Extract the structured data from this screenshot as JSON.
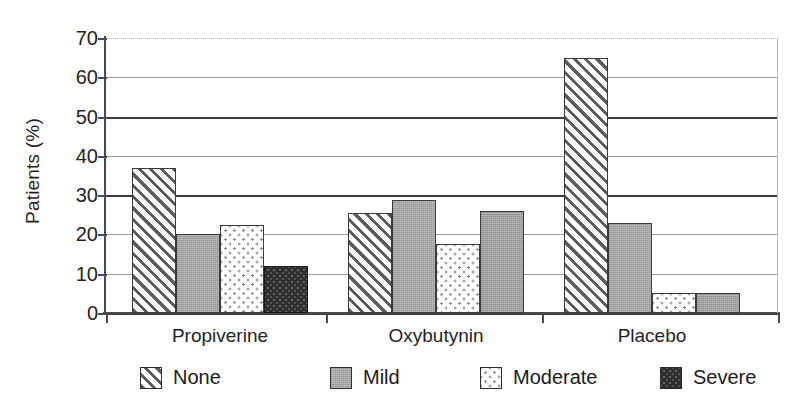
{
  "chart_data": {
    "type": "bar",
    "title": "",
    "subtitle": "",
    "xlabel": "",
    "ylabel": "Patients (%)",
    "ylim": [
      0,
      70
    ],
    "yticks": [
      0,
      10,
      20,
      30,
      40,
      50,
      60,
      70
    ],
    "ytick_labels": [
      "0",
      "10",
      "20",
      "30",
      "40",
      "50",
      "60",
      "70"
    ],
    "categories": [
      "Propiverine",
      "Oxybutynin",
      "Placebo"
    ],
    "grid": "horizontal",
    "legend_position": "bottom",
    "series": [
      {
        "name": "None",
        "pattern": "diagonal-hatch",
        "values": [
          37,
          25.5,
          65
        ]
      },
      {
        "name": "Mild",
        "pattern": "solid-gray",
        "values": [
          20,
          28.8,
          23
        ]
      },
      {
        "name": "Moderate",
        "pattern": "white-dotted",
        "values": [
          22.5,
          17.5,
          5
        ]
      },
      {
        "name": "Severe",
        "pattern": "dark-speckle",
        "values": [
          12,
          26,
          5
        ]
      }
    ],
    "colors": {
      "none": "#5d5d5d",
      "mild": "#a6a6a6",
      "moderate": "#ffffff",
      "severe": "#2e2e2e",
      "axis": "#4a4a4a",
      "grid_light": "#9a9a9a",
      "grid_dark": "#3c3c3c",
      "background": "#ffffff"
    }
  },
  "legend": {
    "items": [
      {
        "label": "None"
      },
      {
        "label": "Mild"
      },
      {
        "label": "Moderate"
      },
      {
        "label": "Severe"
      }
    ]
  }
}
